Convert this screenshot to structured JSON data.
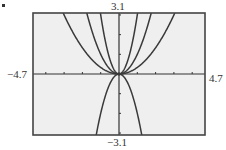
{
  "window": {
    "xmin": "-4.7",
    "xmax": "4.7",
    "ymin": "-3.1",
    "ymax": "3.1"
  },
  "labels": {
    "xmin": "−4.7",
    "xmax": "4.7",
    "ymin": "−3.1",
    "ymax": "3.1"
  },
  "colors": {
    "screen_bg": "#efefef",
    "frame": "#444444",
    "curve": "#3a3a3a",
    "axis": "#333333"
  },
  "chart_data": {
    "type": "line",
    "title": "",
    "xlabel": "",
    "ylabel": "",
    "xlim": [
      -4.7,
      4.7
    ],
    "ylim": [
      -3.1,
      3.1
    ],
    "grid": false,
    "x_ticks": [
      -4,
      -3,
      -2,
      -1,
      0,
      1,
      2,
      3,
      4
    ],
    "y_ticks": [
      -3,
      -2,
      -1,
      0,
      1,
      2,
      3
    ],
    "tick_labels": {
      "left": "−4.7",
      "right": "4.7",
      "top": "3.1",
      "bottom": "−3.1"
    },
    "series": [
      {
        "name": "y = (1/3)x^2",
        "coefficient": 0.3333
      },
      {
        "name": "y = x^2",
        "coefficient": 1
      },
      {
        "name": "y = 3x^2",
        "coefficient": 3
      },
      {
        "name": "y = -2x^2",
        "coefficient": -2
      }
    ],
    "legend": "none"
  }
}
